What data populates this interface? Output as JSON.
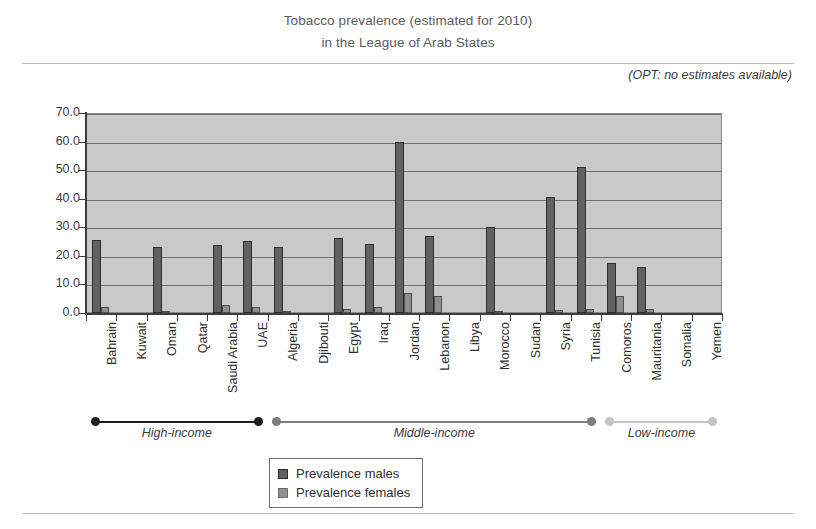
{
  "header": {
    "title_line1": "Tobacco prevalence (estimated for 2010)",
    "title_line2": "in the League of Arab States",
    "note": "(OPT: no estimates available)"
  },
  "legend": {
    "males_label": "Prevalence males",
    "females_label": "Prevalence females",
    "males_color": "#616161",
    "females_color": "#8f8f8f"
  },
  "income_bands": [
    {
      "label": "High-income",
      "color": "#1d1d1d",
      "start_index": 0,
      "end_index": 5
    },
    {
      "label": "Middle-income",
      "color": "#7d7d7d",
      "start_index": 6,
      "end_index": 16
    },
    {
      "label": "Low-income",
      "color": "#c4c4c4",
      "start_index": 17,
      "end_index": 20
    }
  ],
  "chart_data": {
    "type": "bar",
    "title": "Tobacco prevalence (estimated for 2010) in the League of Arab States",
    "subtitle": "in the League of Arab States",
    "annotation": "(OPT: no estimates available)",
    "xlabel": "",
    "ylabel": "",
    "ylim": [
      0,
      70
    ],
    "ytick_step": 10,
    "ytick_labels": [
      "0.0",
      "10.0",
      "20.0",
      "30.0",
      "40.0",
      "50.0",
      "60.0",
      "70.0"
    ],
    "grid": true,
    "legend_position": "bottom-center",
    "categories": [
      "Bahrain",
      "Kuwait",
      "Oman",
      "Qatar",
      "Saudi Arabia",
      "UAE",
      "Algeria",
      "Djibouti",
      "Egypt",
      "Iraq",
      "Jordan",
      "Lebanon",
      "Libya",
      "Morocco",
      "Sudan",
      "Syria",
      "Tunisia",
      "Comoros",
      "Mauritania",
      "Somalia",
      "Yemen"
    ],
    "series": [
      {
        "name": "Prevalence males",
        "color": "#616161",
        "values": [
          25.5,
          0,
          23.2,
          0,
          23.8,
          25.2,
          23.0,
          0,
          26.4,
          24.0,
          60.0,
          27.0,
          0,
          30.0,
          0,
          40.5,
          51.0,
          17.5,
          16.0,
          0,
          0
        ]
      },
      {
        "name": "Prevalence females",
        "color": "#8f8f8f",
        "values": [
          2.0,
          0,
          0.4,
          0,
          2.8,
          2.0,
          0.5,
          0,
          1.4,
          2.0,
          7.0,
          5.8,
          0,
          0.6,
          0,
          1.0,
          1.5,
          6.0,
          1.5,
          0,
          0
        ]
      }
    ]
  }
}
